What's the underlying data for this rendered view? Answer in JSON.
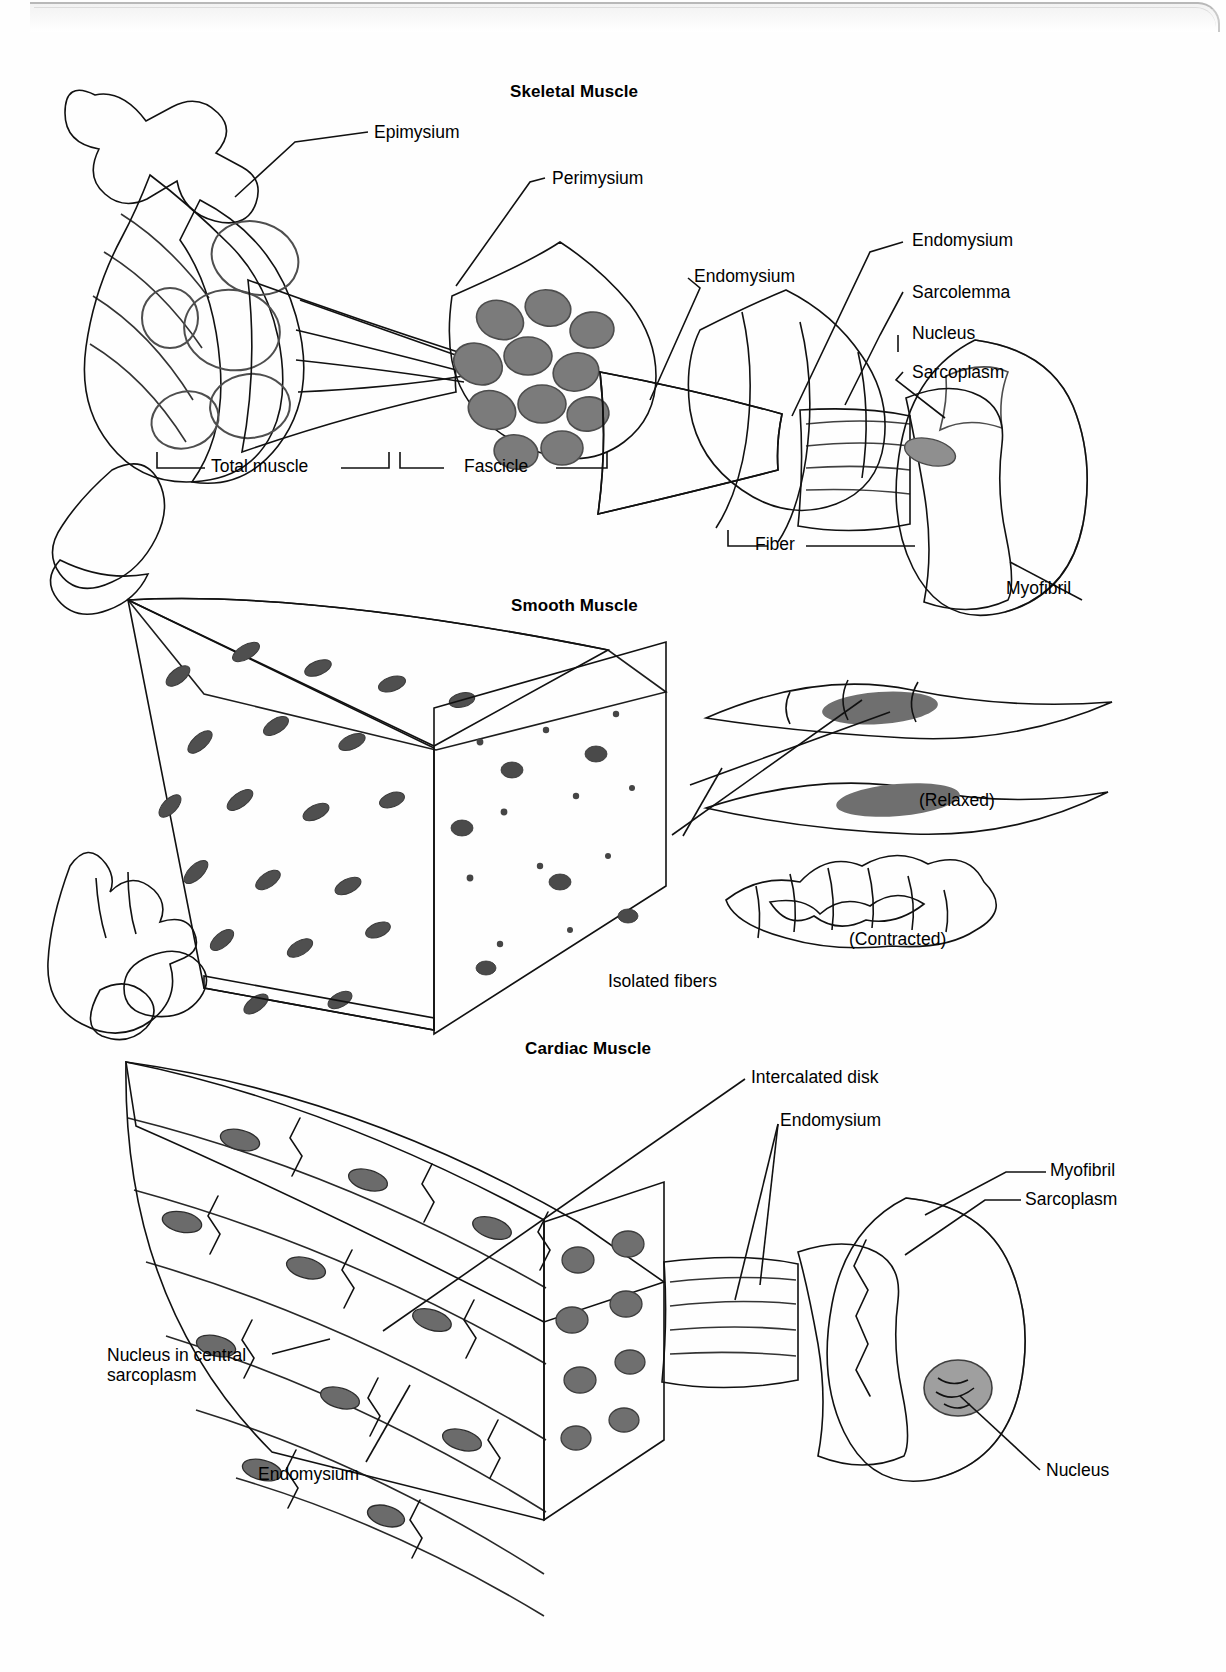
{
  "figure": {
    "domain": "anatomy-illustration"
  },
  "sections": [
    {
      "id": "skeletal",
      "title": "Skeletal Muscle",
      "labels": [
        {
          "key": "epimysium",
          "text": "Epimysium"
        },
        {
          "key": "perimysium",
          "text": "Perimysium"
        },
        {
          "key": "endomysium_left",
          "text": "Endomysium"
        },
        {
          "key": "endomysium_right",
          "text": "Endomysium"
        },
        {
          "key": "sarcolemma",
          "text": "Sarcolemma"
        },
        {
          "key": "nucleus",
          "text": "Nucleus"
        },
        {
          "key": "sarcoplasm",
          "text": "Sarcoplasm"
        },
        {
          "key": "myofibril",
          "text": "Myofibril"
        }
      ],
      "brackets": [
        {
          "key": "total_muscle",
          "text": "Total muscle"
        },
        {
          "key": "fascicle",
          "text": "Fascicle"
        },
        {
          "key": "fiber",
          "text": "Fiber"
        }
      ]
    },
    {
      "id": "smooth",
      "title": "Smooth Muscle",
      "labels": [
        {
          "key": "relaxed",
          "text": "(Relaxed)"
        },
        {
          "key": "contracted",
          "text": "(Contracted)"
        },
        {
          "key": "isolated",
          "text": "Isolated fibers"
        }
      ]
    },
    {
      "id": "cardiac",
      "title": "Cardiac Muscle",
      "labels": [
        {
          "key": "intercalated_disk",
          "text": "Intercalated disk"
        },
        {
          "key": "endomysium_top",
          "text": "Endomysium"
        },
        {
          "key": "myofibril",
          "text": "Myofibril"
        },
        {
          "key": "sarcoplasm",
          "text": "Sarcoplasm"
        },
        {
          "key": "nucleus_central",
          "text": "Nucleus in central sarcoplasm"
        },
        {
          "key": "endomysium_bottom",
          "text": "Endomysium"
        },
        {
          "key": "nucleus",
          "text": "Nucleus"
        }
      ]
    }
  ],
  "colors": {
    "ink": "#111111",
    "paper": "#ffffff",
    "tissue_mid": "#9a9a9a",
    "tissue_dark": "#636363",
    "tissue_light": "#cfcfcf"
  }
}
